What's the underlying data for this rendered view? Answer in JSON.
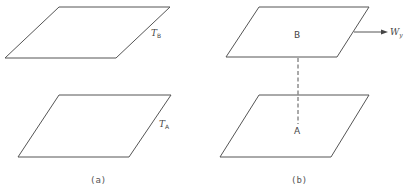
{
  "panels": [
    {
      "id": "a",
      "caption": "(a)",
      "planes": [
        {
          "name": "top-plane",
          "label_main": "T",
          "label_sub": "B"
        },
        {
          "name": "bottom-plane",
          "label_main": "T",
          "label_sub": "A"
        }
      ]
    },
    {
      "id": "b",
      "caption": "(b)",
      "planes": [
        {
          "name": "top-plane",
          "point_label": "B"
        },
        {
          "name": "bottom-plane",
          "point_label": "A"
        }
      ],
      "arrow": {
        "label_main": "W",
        "label_sub": "y"
      }
    }
  ],
  "colors": {
    "line": "#555555",
    "text": "#444444",
    "background": "#ffffff"
  }
}
